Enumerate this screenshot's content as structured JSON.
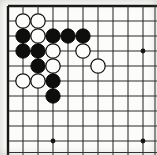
{
  "board": {
    "kind": "go-board-corner-diagram",
    "visible_cols": 10,
    "visible_rows": 10,
    "edge_sides": [
      "top",
      "left"
    ],
    "geometry": {
      "origin_x": 8,
      "origin_y": 6,
      "cell": 15,
      "stone_radius": 7.2,
      "star_radius": 2.4,
      "partial_col_x": 155,
      "partial_row_y": 152.5,
      "canvas_w": 157,
      "canvas_h": 155
    },
    "colors": {
      "paper": "#f7f7f4",
      "paper_center": "#fcfcfa",
      "grid_line": "#2a2a28",
      "edge_line": "#161614",
      "black_stone": "#0e0e0c",
      "black_stone_edge": "#000000",
      "white_stone_fill": "#fdfdfb",
      "white_stone_stroke": "#161614"
    },
    "star_points": [
      {
        "col": 10,
        "row": 4
      },
      {
        "col": 4,
        "row": 10
      },
      {
        "col": 10,
        "row": 10
      }
    ],
    "stones": [
      {
        "col": 2,
        "row": 2,
        "color": "white"
      },
      {
        "col": 3,
        "row": 2,
        "color": "white"
      },
      {
        "col": 2,
        "row": 3,
        "color": "black"
      },
      {
        "col": 3,
        "row": 3,
        "color": "white"
      },
      {
        "col": 4,
        "row": 3,
        "color": "black"
      },
      {
        "col": 5,
        "row": 3,
        "color": "black"
      },
      {
        "col": 6,
        "row": 3,
        "color": "black"
      },
      {
        "col": 2,
        "row": 4,
        "color": "black"
      },
      {
        "col": 3,
        "row": 4,
        "color": "black"
      },
      {
        "col": 4,
        "row": 4,
        "color": "white"
      },
      {
        "col": 6,
        "row": 4,
        "color": "white"
      },
      {
        "col": 3,
        "row": 5,
        "color": "black"
      },
      {
        "col": 4,
        "row": 5,
        "color": "white"
      },
      {
        "col": 7,
        "row": 5,
        "color": "white"
      },
      {
        "col": 2,
        "row": 6,
        "color": "white"
      },
      {
        "col": 3,
        "row": 6,
        "color": "white"
      },
      {
        "col": 4,
        "row": 6,
        "color": "black"
      },
      {
        "col": 4,
        "row": 7,
        "color": "black"
      }
    ]
  }
}
